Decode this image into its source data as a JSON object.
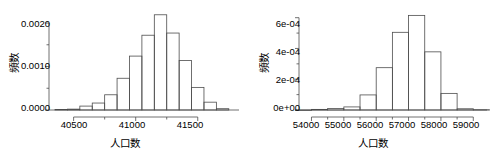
{
  "figure": {
    "panel_count": 2,
    "background": "#ffffff",
    "line_color": "#4d4d4d",
    "text_color": "#000000"
  },
  "chart_data": [
    {
      "type": "bar",
      "id": "histogram-left",
      "title": "",
      "xlabel": "人口数",
      "ylabel": "頻数",
      "xlim": [
        40350,
        41800
      ],
      "ylim": [
        0,
        0.0023
      ],
      "xticks": [
        40500,
        41000,
        41500
      ],
      "xtick_labels": [
        "40500",
        "41000",
        "41500"
      ],
      "xminor_ticks": [
        40500,
        40750,
        41000,
        41250,
        41500
      ],
      "yticks": [
        0.0,
        0.001,
        0.002
      ],
      "ytick_labels": [
        "0.0000",
        "0.0010",
        "0.0020"
      ],
      "yminor_ticks": [
        0.0005,
        0.0015
      ],
      "grid": false,
      "legend": null,
      "bin_width": 100,
      "bin_edges": [
        40350,
        40450,
        40550,
        40650,
        40750,
        40850,
        40950,
        41050,
        41150,
        41250,
        41350,
        41450,
        41550,
        41650,
        41750
      ],
      "categories": [
        "40350-40450",
        "40450-40550",
        "40550-40650",
        "40650-40750",
        "40750-40850",
        "40850-40950",
        "40950-41050",
        "41050-41150",
        "41150-41250",
        "41250-41350",
        "41350-41450",
        "41450-41550",
        "41550-41650",
        "41650-41750"
      ],
      "values": [
        1e-05,
        2e-05,
        9e-05,
        0.00016,
        0.00035,
        0.00073,
        0.00124,
        0.00172,
        0.00219,
        0.00177,
        0.00114,
        0.00052,
        0.00018,
        3e-05
      ]
    },
    {
      "type": "bar",
      "id": "histogram-right",
      "title": "",
      "xlabel": "人口数",
      "ylabel": "頻数",
      "xlim": [
        53800,
        59300
      ],
      "ylim": [
        0,
        0.00065
      ],
      "xticks": [
        54000,
        55000,
        56000,
        57000,
        58000,
        59000
      ],
      "xtick_labels": [
        "54000",
        "55000",
        "56000",
        "57000",
        "58000",
        "59000"
      ],
      "xminor_ticks": [
        54000,
        54500,
        55000,
        55500,
        56000,
        56500,
        57000,
        57500,
        58000,
        58500,
        59000
      ],
      "yticks": [
        0.0,
        0.0002,
        0.0004,
        0.0006
      ],
      "ytick_labels": [
        "0e+00",
        "2e-04",
        "4e-04",
        "6e-04"
      ],
      "yminor_ticks": [
        0.0001,
        0.0003,
        0.0005
      ],
      "grid": false,
      "legend": null,
      "bin_width": 500,
      "bin_edges": [
        53500,
        54000,
        54500,
        55000,
        55500,
        56000,
        56500,
        57000,
        57500,
        58000,
        58500,
        59000,
        59500
      ],
      "categories": [
        "53500-54000",
        "54000-54500",
        "54500-55000",
        "55000-55500",
        "55500-56000",
        "56000-56500",
        "56500-57000",
        "57000-57500",
        "57500-58000",
        "58000-58500",
        "58500-59000",
        "59000-59500"
      ],
      "values": [
        0.0,
        4e-06,
        1e-05,
        2e-05,
        9.8e-05,
        0.000275,
        0.000505,
        0.000615,
        0.000378,
        0.000108,
        8e-06,
        2e-06
      ]
    }
  ]
}
